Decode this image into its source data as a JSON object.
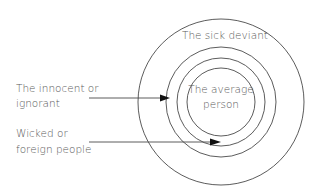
{
  "diagram": {
    "rings": [
      {
        "name": "outer",
        "cx": 221,
        "cy": 102,
        "r": 83
      },
      {
        "name": "ring2",
        "cx": 221,
        "cy": 102,
        "r": 55
      },
      {
        "name": "ring3",
        "cx": 221,
        "cy": 102,
        "r": 44
      },
      {
        "name": "inner",
        "cx": 221,
        "cy": 102,
        "r": 34
      }
    ],
    "labels": {
      "sick_deviant": "The sick deviant",
      "average_line1": "The average",
      "average_line2": "person",
      "innocent_line1": "The innocent or",
      "innocent_line2": "ignorant",
      "wicked_line1": "Wicked or",
      "wicked_line2": "foreign people"
    },
    "arrows": [
      {
        "name": "innocent-arrow",
        "x1": 89,
        "y1": 98,
        "x2": 170,
        "y2": 98
      },
      {
        "name": "wicked-arrow",
        "x1": 89,
        "y1": 142,
        "x2": 221,
        "y2": 142
      }
    ],
    "colors": {
      "line": "#4a4a4a",
      "arrowhead": "#111111",
      "text": "#5a5a5a"
    }
  }
}
